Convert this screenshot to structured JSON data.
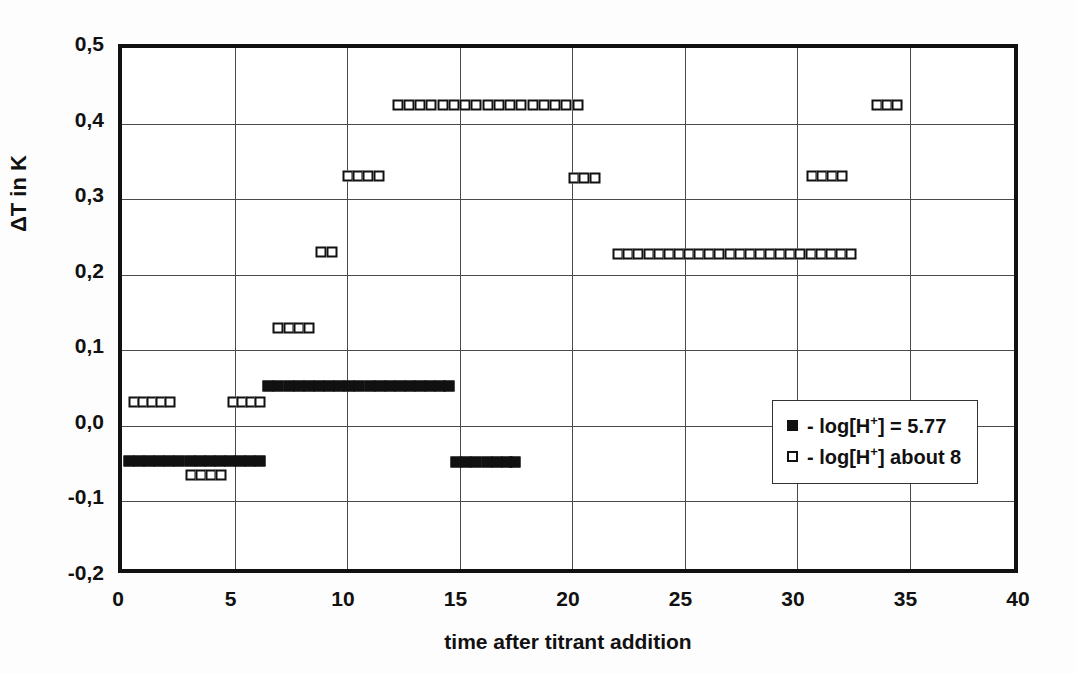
{
  "chart_data": {
    "type": "scatter",
    "title": "",
    "xlabel": "time after titrant addition",
    "ylabel": "ΔT in K",
    "xlim": [
      0,
      40
    ],
    "ylim": [
      -0.2,
      0.5
    ],
    "xticks": [
      "0",
      "5",
      "10",
      "15",
      "20",
      "25",
      "30",
      "35",
      "40"
    ],
    "xtick_values": [
      0,
      5,
      10,
      15,
      20,
      25,
      30,
      35,
      40
    ],
    "yticks": [
      "0,5",
      "0,4",
      "0,3",
      "0,2",
      "0,1",
      "0,0",
      "-0,1",
      "-0,2"
    ],
    "ytick_values": [
      0.5,
      0.4,
      0.3,
      0.2,
      0.1,
      0.0,
      -0.1,
      -0.2
    ],
    "grid": true,
    "decimal_separator": "comma",
    "legend_position": "inside-right",
    "series": [
      {
        "name": "- log[H+] = 5.77",
        "marker": "filled-square",
        "color": "#111111",
        "points": [
          [
            0.3,
            -0.046
          ],
          [
            0.75,
            -0.046
          ],
          [
            1.2,
            -0.046
          ],
          [
            1.65,
            -0.046
          ],
          [
            2.1,
            -0.046
          ],
          [
            2.55,
            -0.046
          ],
          [
            3.0,
            -0.046
          ],
          [
            3.45,
            -0.046
          ],
          [
            3.9,
            -0.046
          ],
          [
            4.35,
            -0.046
          ],
          [
            4.8,
            -0.046
          ],
          [
            5.25,
            -0.046
          ],
          [
            5.7,
            -0.046
          ],
          [
            6.15,
            -0.046
          ],
          [
            6.5,
            0.053
          ],
          [
            6.95,
            0.053
          ],
          [
            7.4,
            0.053
          ],
          [
            7.85,
            0.053
          ],
          [
            8.3,
            0.053
          ],
          [
            8.75,
            0.053
          ],
          [
            9.2,
            0.053
          ],
          [
            9.65,
            0.053
          ],
          [
            10.1,
            0.053
          ],
          [
            10.55,
            0.053
          ],
          [
            11.0,
            0.053
          ],
          [
            11.45,
            0.053
          ],
          [
            11.9,
            0.053
          ],
          [
            12.35,
            0.053
          ],
          [
            12.8,
            0.053
          ],
          [
            13.25,
            0.053
          ],
          [
            13.7,
            0.053
          ],
          [
            14.15,
            0.053
          ],
          [
            14.55,
            0.053
          ],
          [
            14.85,
            -0.048
          ],
          [
            15.3,
            -0.048
          ],
          [
            15.75,
            -0.048
          ],
          [
            16.2,
            -0.048
          ],
          [
            16.65,
            -0.048
          ],
          [
            17.1,
            -0.048
          ],
          [
            17.45,
            -0.048
          ]
        ]
      },
      {
        "name": "- log[H+] about 8",
        "marker": "open-square",
        "color": "#111111",
        "points": [
          [
            0.55,
            0.032
          ],
          [
            0.95,
            0.032
          ],
          [
            1.35,
            0.032
          ],
          [
            1.75,
            0.032
          ],
          [
            2.15,
            0.032
          ],
          [
            3.05,
            -0.065
          ],
          [
            3.5,
            -0.065
          ],
          [
            3.95,
            -0.065
          ],
          [
            4.4,
            -0.065
          ],
          [
            4.95,
            0.032
          ],
          [
            5.35,
            0.032
          ],
          [
            5.75,
            0.032
          ],
          [
            6.15,
            0.032
          ],
          [
            6.95,
            0.13
          ],
          [
            7.4,
            0.13
          ],
          [
            7.85,
            0.13
          ],
          [
            8.3,
            0.13
          ],
          [
            8.85,
            0.23
          ],
          [
            9.35,
            0.23
          ],
          [
            10.05,
            0.33
          ],
          [
            10.5,
            0.33
          ],
          [
            10.95,
            0.33
          ],
          [
            11.4,
            0.33
          ],
          [
            12.25,
            0.425
          ],
          [
            12.75,
            0.425
          ],
          [
            13.25,
            0.425
          ],
          [
            13.75,
            0.425
          ],
          [
            14.25,
            0.425
          ],
          [
            14.75,
            0.425
          ],
          [
            15.25,
            0.425
          ],
          [
            15.75,
            0.425
          ],
          [
            16.25,
            0.425
          ],
          [
            16.75,
            0.425
          ],
          [
            17.25,
            0.425
          ],
          [
            17.75,
            0.425
          ],
          [
            18.25,
            0.425
          ],
          [
            18.75,
            0.425
          ],
          [
            19.25,
            0.425
          ],
          [
            19.75,
            0.425
          ],
          [
            20.25,
            0.425
          ],
          [
            20.1,
            0.328
          ],
          [
            20.55,
            0.328
          ],
          [
            21.0,
            0.328
          ],
          [
            22.05,
            0.227
          ],
          [
            22.5,
            0.227
          ],
          [
            22.95,
            0.227
          ],
          [
            23.4,
            0.227
          ],
          [
            23.85,
            0.227
          ],
          [
            24.3,
            0.227
          ],
          [
            24.75,
            0.227
          ],
          [
            25.2,
            0.227
          ],
          [
            25.65,
            0.227
          ],
          [
            26.1,
            0.227
          ],
          [
            26.55,
            0.227
          ],
          [
            27.0,
            0.227
          ],
          [
            27.45,
            0.227
          ],
          [
            27.9,
            0.227
          ],
          [
            28.35,
            0.227
          ],
          [
            28.8,
            0.227
          ],
          [
            29.25,
            0.227
          ],
          [
            29.7,
            0.227
          ],
          [
            30.15,
            0.227
          ],
          [
            30.6,
            0.227
          ],
          [
            31.05,
            0.227
          ],
          [
            31.5,
            0.227
          ],
          [
            31.95,
            0.227
          ],
          [
            32.4,
            0.227
          ],
          [
            30.65,
            0.33
          ],
          [
            31.1,
            0.33
          ],
          [
            31.55,
            0.33
          ],
          [
            32.0,
            0.33
          ],
          [
            33.55,
            0.425
          ],
          [
            34.0,
            0.425
          ],
          [
            34.45,
            0.425
          ]
        ]
      }
    ]
  },
  "legend": {
    "entries": [
      {
        "marker": "filled-square",
        "prefix": "- log[H",
        "sup": "+",
        "suffix": "] = 5.77"
      },
      {
        "marker": "open-square",
        "prefix": "- log[H",
        "sup": "+",
        "suffix": "] about 8"
      }
    ]
  },
  "axes": {
    "y_title": "ΔT in K",
    "x_title": "time after titrant addition"
  }
}
